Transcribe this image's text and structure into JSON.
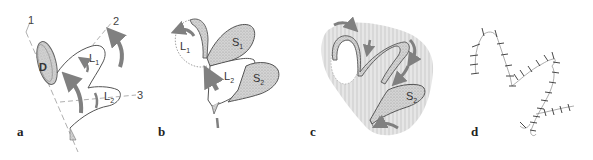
{
  "figure": {
    "panels": [
      {
        "id": "a",
        "label": "a",
        "structures": {
          "disk": "D",
          "lobe1": "L",
          "lobe1_sub": "1",
          "lobe2": "L",
          "lobe2_sub": "2"
        },
        "axes": [
          "1",
          "2",
          "3"
        ]
      },
      {
        "id": "b",
        "label": "b",
        "structures": {
          "lobe1": "L",
          "lobe1_sub": "1",
          "lobe2": "L",
          "lobe2_sub": "2",
          "seg1": "S",
          "seg1_sub": "1",
          "seg2": "S",
          "seg2_sub": "2"
        }
      },
      {
        "id": "c",
        "label": "c",
        "structures": {
          "seg2": "S",
          "seg2_sub": "2"
        }
      },
      {
        "id": "d",
        "label": "d"
      }
    ],
    "colors": {
      "arrow": "#808080",
      "outline": "#555555",
      "stipple": "#bdbdbd",
      "hatch_bg": "#d9d9d9",
      "axis_line": "#9a9a9a"
    }
  }
}
